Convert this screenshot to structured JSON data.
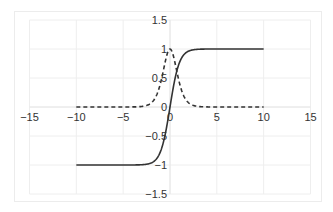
{
  "chart_data": {
    "type": "line",
    "title": "",
    "xlabel": "",
    "ylabel": "",
    "xlim": [
      -15,
      15
    ],
    "ylim": [
      -1.5,
      1.5
    ],
    "grid": true,
    "legend": null,
    "x_ticks": [
      "−15",
      "−10",
      "−5",
      "0",
      "5",
      "10",
      "15"
    ],
    "y_ticks": [
      "1.5",
      "1",
      "0.5",
      "0",
      "−0.5",
      "−1",
      "−1.5"
    ],
    "x_tick_values": [
      -15,
      -10,
      -5,
      0,
      5,
      10,
      15
    ],
    "y_tick_values": [
      1.5,
      1,
      0.5,
      0,
      -0.5,
      -1,
      -1.5
    ],
    "series": [
      {
        "name": "tanh(x)",
        "style": "solid",
        "color": "#333333",
        "x_range": [
          -10,
          10
        ],
        "sample_points": {
          "x": [
            -10,
            -3,
            -2,
            -1,
            -0.5,
            0,
            0.5,
            1,
            2,
            3,
            10
          ],
          "y": [
            -1.0,
            -0.995,
            -0.964,
            -0.762,
            -0.462,
            0.0,
            0.462,
            0.762,
            0.964,
            0.995,
            1.0
          ]
        }
      },
      {
        "name": "derivative 1 - tanh^2(x)",
        "style": "dashed",
        "color": "#333333",
        "x_range": [
          -10,
          10
        ],
        "sample_points": {
          "x": [
            -10,
            -3,
            -2,
            -1,
            -0.5,
            0,
            0.5,
            1,
            2,
            3,
            10
          ],
          "y": [
            0.0,
            0.01,
            0.071,
            0.42,
            0.786,
            1.0,
            0.786,
            0.42,
            0.071,
            0.01,
            0.0
          ]
        }
      }
    ]
  }
}
